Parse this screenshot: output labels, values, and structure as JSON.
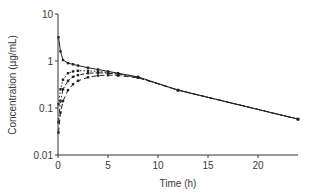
{
  "chart_data": {
    "type": "line",
    "title": "",
    "xlabel": "Time (h)",
    "ylabel": "Concentration (µg/mL)",
    "yscale": "log",
    "xlim": [
      0,
      24
    ],
    "ylim": [
      0.01,
      10
    ],
    "x_ticks": [
      0,
      5,
      10,
      15,
      20
    ],
    "x_tick_labels": [
      "0",
      "5",
      "10",
      "15",
      "20"
    ],
    "y_ticks": [
      0.01,
      0.1,
      1,
      10
    ],
    "y_tick_labels": [
      "0.01",
      "0.1",
      "1",
      "10"
    ],
    "grid": false,
    "legend": null,
    "series": [
      {
        "name": "IV bolus",
        "style": "solid",
        "x": [
          0.05,
          0.25,
          0.5,
          1,
          1.5,
          2,
          3,
          4,
          5,
          6,
          8,
          12,
          24
        ],
        "y": [
          3.2,
          1.6,
          1.05,
          0.9,
          0.85,
          0.8,
          0.72,
          0.66,
          0.6,
          0.55,
          0.46,
          0.24,
          0.058
        ]
      },
      {
        "name": "absorption fast",
        "style": "dotted",
        "x": [
          0.05,
          0.25,
          0.5,
          1,
          1.5,
          2,
          3,
          4,
          5,
          6,
          8,
          12,
          24
        ],
        "y": [
          0.12,
          0.25,
          0.4,
          0.55,
          0.6,
          0.62,
          0.62,
          0.6,
          0.57,
          0.53,
          0.45,
          0.24,
          0.058
        ]
      },
      {
        "name": "absorption medium",
        "style": "dashdot",
        "x": [
          0.05,
          0.25,
          0.5,
          1,
          1.5,
          2,
          3,
          4,
          5,
          6,
          8,
          12,
          24
        ],
        "y": [
          0.05,
          0.14,
          0.25,
          0.38,
          0.46,
          0.5,
          0.55,
          0.56,
          0.55,
          0.52,
          0.45,
          0.24,
          0.058
        ]
      },
      {
        "name": "absorption slow",
        "style": "dashed",
        "x": [
          0.05,
          0.25,
          0.5,
          1,
          1.5,
          2,
          3,
          4,
          5,
          6,
          8,
          12,
          24
        ],
        "y": [
          0.03,
          0.08,
          0.14,
          0.24,
          0.32,
          0.38,
          0.45,
          0.49,
          0.5,
          0.49,
          0.44,
          0.24,
          0.058
        ]
      }
    ],
    "colors": {
      "axis": "#333333",
      "series": "#222222",
      "text": "#3a3a3a"
    }
  }
}
